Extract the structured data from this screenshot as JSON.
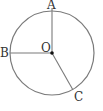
{
  "diagram": {
    "type": "circle-with-radii",
    "colors": {
      "stroke": "#7a7a7a",
      "text": "#333333",
      "center_dot": "#111111"
    },
    "circle": {
      "cx": 52,
      "cy": 53,
      "r": 42
    },
    "center": {
      "label": "O",
      "x": 52,
      "y": 53
    },
    "points": [
      {
        "label": "A",
        "x": 52,
        "y": 11
      },
      {
        "label": "B",
        "x": 10,
        "y": 53
      },
      {
        "label": "C",
        "x": 73,
        "y": 90
      }
    ],
    "radii": [
      "OA",
      "OB",
      "OC"
    ]
  }
}
